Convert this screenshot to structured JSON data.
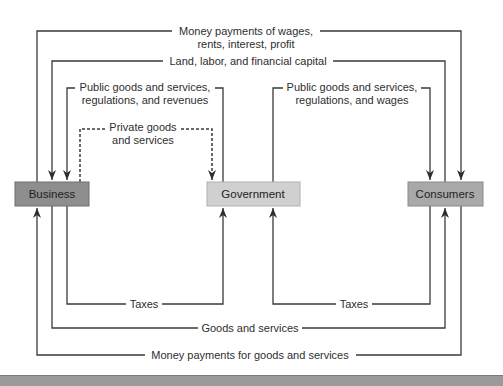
{
  "diagram": {
    "type": "circular-flow",
    "entities": {
      "business": {
        "label": "Business",
        "fill": "#8e8e8e"
      },
      "government": {
        "label": "Government",
        "fill": "#d0d0d0"
      },
      "consumers": {
        "label": "Consumers",
        "fill": "#a9a9a9"
      }
    },
    "flows": {
      "wages_line1": "Money payments of wages,",
      "wages_line2": "rents, interest, profit",
      "factors": "Land, labor, and financial capital",
      "gov_to_business_line1": "Public goods and services,",
      "gov_to_business_line2": "regulations, and revenues",
      "private_line1": "Private goods",
      "private_line2": "and services",
      "gov_to_consumers_line1": "Public goods and services,",
      "gov_to_consumers_line2": "regulations, and wages",
      "business_taxes": "Taxes",
      "consumer_taxes": "Taxes",
      "goods": "Goods and services",
      "money_goods": "Money payments for goods and services"
    }
  }
}
